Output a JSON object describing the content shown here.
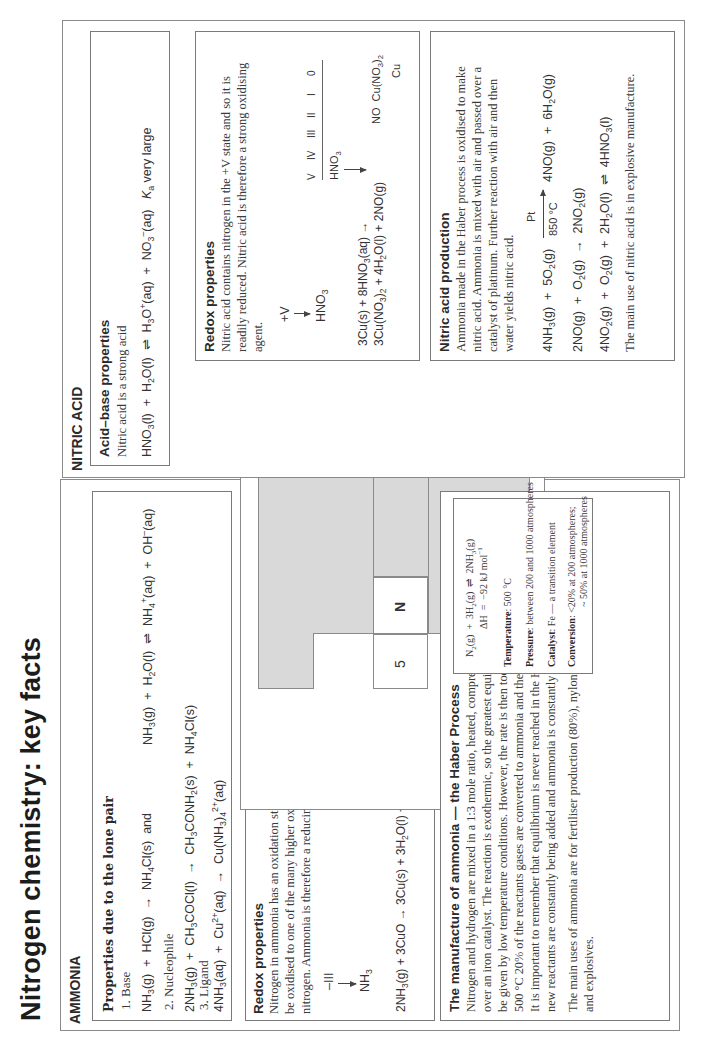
{
  "title": "Nitrogen chemistry: key facts",
  "ammonia": {
    "heading": "AMMONIA",
    "lone_pair": {
      "heading": "Properties due to the lone pair",
      "base_label": "1.  Base",
      "base_eq_1": "NH3(g) + HCl(g) → NH4Cl(s)  and",
      "base_eq_2": "NH3(g) + H2O(l) ⇌ NH4+(aq) + OH−(aq)",
      "nucleophile_label": "2.  Nucleophile",
      "nucleophile_eq": "2NH3(g) + CH3COCl(l) → CH3CONH2(s) + NH4Cl(s)",
      "ligand_label": "3.  Ligand",
      "ligand_eq": "4NH3(aq) + Cu2+(aq) → Cu(NH3)42+(aq)"
    },
    "redox": {
      "heading": "Redox properties",
      "text": "Nitrogen in ammonia has an oxidation state of –III and so can be oxidised to one of the many higher oxidation states of nitrogen. Ammonia is therefore a reducing agent.",
      "state_label": "–III",
      "species": "NH3",
      "equation": "2NH3(g) + 3CuO → 3Cu(s) + 3H2O(l) + N2",
      "ladder_levels": [
        "II",
        "I",
        "0",
        "–I",
        "–II",
        "–III"
      ],
      "ladder_species": {
        "cuo": "CuO",
        "cu": "Cu",
        "n2": "N2",
        "nh3": "NH3"
      }
    },
    "haber": {
      "heading": "The manufacture of ammonia — the Haber Process",
      "lines": [
        "Nitrogen and hydrogen are mixed in a 1:3 mole ratio, heated, compressed, and passed",
        "over an iron catalyst. The reaction is exothermic, so the greatest equilibrium yield would",
        "be given by low temperature conditions. However, the rate is then too slow. At about",
        "500 °C 20% of the reactants gases are converted to ammonia and the remainder recycled.",
        "It is important to remember that equilibrium is never reached in the Haber process where",
        "new reactants are constantly being added and ammonia is constantly being removed."
      ],
      "uses_lines": [
        "The main uses of ammonia are for fertiliser production (80%), nylons, and nitric acid",
        "and explosives."
      ],
      "conditions": {
        "equation": "N2(g) + 3H2(g) ⇌ 2NH3(g)",
        "enthalpy": "ΔH = −92 kJ mol−1",
        "temperature_label": "Temperature",
        "temperature_value": ": 500 °C",
        "pressure_label": "Pressure",
        "pressure_value": ": between 200 and 1000 atmospheres",
        "catalyst_label": "Catalyst",
        "catalyst_value": ": Fe — a transition element",
        "conversion_label": "Conversion",
        "conversion_value_1": ": <20% at 200 atmospheres;",
        "conversion_value_2": "~ 50% at 1000 atmospheres"
      }
    }
  },
  "periodic_graphic": {
    "group_label": "5",
    "element_symbol": "N",
    "fill_color": "#d9d9d9"
  },
  "nitric_acid": {
    "heading": "NITRIC ACID",
    "acid_base": {
      "heading": "Acid–base properties",
      "text": "Nitric acid is a strong acid",
      "equation": "HNO3(l) + H2O(l) ⇌ H3O+(aq) + NO3−(aq)",
      "ka_note": "Ka very large"
    },
    "redox": {
      "heading": "Redox properties",
      "lines": [
        "Nitric acid contains nitrogen in the +V state and so it is",
        "readily reduced. Nitric acid is therefore a strong oxidising",
        "agent."
      ],
      "state_label": "+V",
      "species": "HNO3",
      "equation_1": "3Cu(s) + 8HNO3(aq) →",
      "equation_2": "3Cu(NO3)2 + 4H2O(l) + 2NO(g)",
      "ladder_levels": [
        "V",
        "IV",
        "III",
        "II",
        "I",
        "0"
      ],
      "ladder_species": {
        "hno3": "HNO3",
        "no": "NO",
        "cuno3": "Cu(NO3)2",
        "cu": "Cu"
      }
    },
    "production": {
      "heading": "Nitric acid production",
      "lines": [
        "Ammonia made in the Haber process is oxidised to make",
        "nitric acid. Ammonia is mixed with air and passed over a",
        "catalyst of platinum. Further reaction with air and then",
        "water yields nitric acid."
      ],
      "eq1_left": "4NH3(g) + 5O2(g)",
      "eq1_catalyst": "Pt",
      "eq1_temp": "850 °C",
      "eq1_right": "4NO(g) + 6H2O(g)",
      "eq2": "2NO(g) + O2(g) → 2NO2(g)",
      "eq3": "4NO2(g) + O2(g) + 2H2O(l) ⇌ 4HNO3(l)",
      "use": "The main use of nitric acid is in explosive manufacture."
    }
  }
}
